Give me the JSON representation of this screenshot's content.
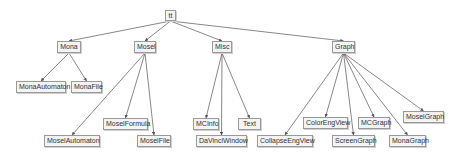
{
  "diagram": {
    "type": "tree",
    "root": "tt",
    "nodes": [
      {
        "id": "tt",
        "label": "tt"
      },
      {
        "id": "Mona",
        "label": "Mona"
      },
      {
        "id": "Mosel",
        "label": "Mosel"
      },
      {
        "id": "Misc",
        "label": "Misc"
      },
      {
        "id": "Graph",
        "label": "Graph"
      },
      {
        "id": "MonaAutomaton",
        "label": "MonaAutomaton"
      },
      {
        "id": "MonaFile",
        "label": "MonaFile"
      },
      {
        "id": "MoselAutomaton",
        "label": "MoselAutomaton"
      },
      {
        "id": "MoselFormula",
        "label": "MoselFormula"
      },
      {
        "id": "MoselFile",
        "label": "MoselFile"
      },
      {
        "id": "MCInfo",
        "label": "MCInfo"
      },
      {
        "id": "DaVinciWindow",
        "label": "DaVinciWindow"
      },
      {
        "id": "Text",
        "label": "Text"
      },
      {
        "id": "CollapseEngView",
        "label": "CollapseEngView"
      },
      {
        "id": "ColorEngView",
        "label": "ColorEngView"
      },
      {
        "id": "ScreenGraph",
        "label": "ScreenGraph"
      },
      {
        "id": "MCGraph",
        "label": "MCGraph"
      },
      {
        "id": "MonaGraph",
        "label": "MonaGraph"
      },
      {
        "id": "MoselGraph",
        "label": "MoselGraph"
      }
    ],
    "edges": [
      [
        "tt",
        "Mona"
      ],
      [
        "tt",
        "Mosel"
      ],
      [
        "tt",
        "Misc"
      ],
      [
        "tt",
        "Graph"
      ],
      [
        "Mona",
        "MonaAutomaton"
      ],
      [
        "Mona",
        "MonaFile"
      ],
      [
        "Mosel",
        "MoselAutomaton"
      ],
      [
        "Mosel",
        "MoselFormula"
      ],
      [
        "Mosel",
        "MoselFile"
      ],
      [
        "Misc",
        "MCInfo"
      ],
      [
        "Misc",
        "DaVinciWindow"
      ],
      [
        "Misc",
        "Text"
      ],
      [
        "Graph",
        "CollapseEngView"
      ],
      [
        "Graph",
        "ColorEngView"
      ],
      [
        "Graph",
        "ScreenGraph"
      ],
      [
        "Graph",
        "MCGraph"
      ],
      [
        "Graph",
        "MonaGraph"
      ],
      [
        "Graph",
        "MoselGraph"
      ]
    ],
    "colors": {
      "edge": "#555555",
      "node_border": "#9a9a9a",
      "node_fill": "#f4f4f4",
      "text": "#333333"
    }
  }
}
